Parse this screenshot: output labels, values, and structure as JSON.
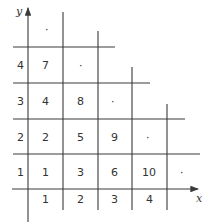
{
  "axes": {
    "x_label": "x",
    "y_label": "y",
    "x_ticks": [
      "1",
      "2",
      "3",
      "4"
    ],
    "y_ticks": [
      "1",
      "2",
      "3",
      "4"
    ]
  },
  "cells": {
    "r1": [
      "1",
      "3",
      "6",
      "10",
      "·"
    ],
    "r2": [
      "2",
      "5",
      "9",
      "·"
    ],
    "r3": [
      "4",
      "8",
      "·"
    ],
    "r4": [
      "7",
      "·"
    ],
    "r5": [
      "·"
    ]
  },
  "colors": {
    "line": "#3a3a3a",
    "text": "#333333",
    "background": "#ffffff"
  }
}
